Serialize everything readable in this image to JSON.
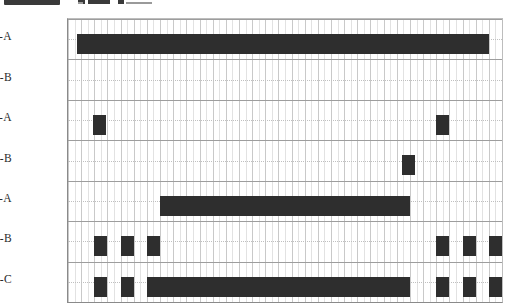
{
  "chart_data": {
    "type": "bar",
    "title": "",
    "subtitle": "",
    "xlabel": "",
    "ylabel": "",
    "orientation": "horizontal",
    "grid": true,
    "legend": false,
    "legend_position": "none",
    "bar_color": "#2e2e2e",
    "plot_background": "#ffffff",
    "axis_color": "#8a8a8a",
    "grid_major_color": "#c9c9c9",
    "grid_minor_color": "#e2e2e2",
    "x_axis": {
      "min": 0,
      "max": 33,
      "tick_labels": [],
      "major_interval": 1,
      "minor_interval": 0.5,
      "note": "unlabeled time-like axis, 33 major columns"
    },
    "categories": [
      "SS-A",
      "SS-B",
      "PB-A",
      "PB-B",
      "PL-A",
      "PL-B",
      "PL-C"
    ],
    "series": [
      {
        "name": "SS-A",
        "intervals": [
          {
            "start": 0.7,
            "end": 32.0
          }
        ]
      },
      {
        "name": "SS-B",
        "intervals": []
      },
      {
        "name": "PB-A",
        "intervals": [
          {
            "start": 1.9,
            "end": 2.9
          },
          {
            "start": 28.0,
            "end": 29.0
          }
        ]
      },
      {
        "name": "PB-B",
        "intervals": [
          {
            "start": 25.4,
            "end": 26.4
          }
        ]
      },
      {
        "name": "PL-A",
        "intervals": [
          {
            "start": 7.0,
            "end": 26.0
          }
        ]
      },
      {
        "name": "PL-B",
        "intervals": [
          {
            "start": 2.0,
            "end": 3.0
          },
          {
            "start": 4.0,
            "end": 5.0
          },
          {
            "start": 6.0,
            "end": 7.0
          },
          {
            "start": 28.0,
            "end": 29.0
          },
          {
            "start": 30.0,
            "end": 31.0
          },
          {
            "start": 32.0,
            "end": 33.0
          }
        ]
      },
      {
        "name": "PL-C",
        "intervals": [
          {
            "start": 2.0,
            "end": 3.0
          },
          {
            "start": 4.0,
            "end": 5.0
          },
          {
            "start": 6.0,
            "end": 26.0
          },
          {
            "start": 28.0,
            "end": 29.0
          },
          {
            "start": 30.0,
            "end": 31.0
          },
          {
            "start": 32.0,
            "end": 33.0
          }
        ]
      }
    ]
  },
  "axis_labels": {
    "row_0": "SS-A",
    "row_1": "SS-B",
    "row_2": "PB-A",
    "row_3": "PB-B",
    "row_4": "PL-A",
    "row_5": "PL-B",
    "row_6": "PL-C"
  },
  "top_artifact": {
    "description": "cropped-dark-strip"
  }
}
